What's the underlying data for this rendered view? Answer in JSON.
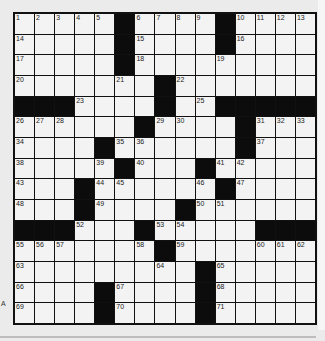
{
  "puzzle": {
    "size": {
      "rows": 15,
      "cols": 15
    },
    "layout": [
      ".....#....#....",
      ".....#....#....",
      ".....#.........",
      ".......#.......",
      "###....#..#####",
      "......#....#...",
      "....#......#...",
      ".....#...#.....",
      "...#......#....",
      "...#....#......",
      "###...#.....###",
      ".......#.......",
      ".........#.....",
      "....#....#.....",
      "....#....#....."
    ],
    "numbers": [
      {
        "r": 0,
        "c": 0,
        "n": "1"
      },
      {
        "r": 0,
        "c": 1,
        "n": "2"
      },
      {
        "r": 0,
        "c": 2,
        "n": "3"
      },
      {
        "r": 0,
        "c": 3,
        "n": "4"
      },
      {
        "r": 0,
        "c": 4,
        "n": "5"
      },
      {
        "r": 0,
        "c": 6,
        "n": "6"
      },
      {
        "r": 0,
        "c": 7,
        "n": "7"
      },
      {
        "r": 0,
        "c": 8,
        "n": "8"
      },
      {
        "r": 0,
        "c": 9,
        "n": "9"
      },
      {
        "r": 0,
        "c": 11,
        "n": "10"
      },
      {
        "r": 0,
        "c": 12,
        "n": "11"
      },
      {
        "r": 0,
        "c": 13,
        "n": "12"
      },
      {
        "r": 0,
        "c": 14,
        "n": "13"
      },
      {
        "r": 1,
        "c": 0,
        "n": "14"
      },
      {
        "r": 1,
        "c": 6,
        "n": "15"
      },
      {
        "r": 1,
        "c": 11,
        "n": "16"
      },
      {
        "r": 2,
        "c": 0,
        "n": "17"
      },
      {
        "r": 2,
        "c": 6,
        "n": "18"
      },
      {
        "r": 2,
        "c": 10,
        "n": "19"
      },
      {
        "r": 3,
        "c": 0,
        "n": "20"
      },
      {
        "r": 3,
        "c": 5,
        "n": "21"
      },
      {
        "r": 3,
        "c": 8,
        "n": "22"
      },
      {
        "r": 4,
        "c": 3,
        "n": "23"
      },
      {
        "r": 4,
        "c": 7,
        "n": "24"
      },
      {
        "r": 4,
        "c": 9,
        "n": "25"
      },
      {
        "r": 5,
        "c": 0,
        "n": "26"
      },
      {
        "r": 5,
        "c": 1,
        "n": "27"
      },
      {
        "r": 5,
        "c": 2,
        "n": "28"
      },
      {
        "r": 5,
        "c": 7,
        "n": "29"
      },
      {
        "r": 5,
        "c": 8,
        "n": "30"
      },
      {
        "r": 5,
        "c": 12,
        "n": "31"
      },
      {
        "r": 5,
        "c": 13,
        "n": "32"
      },
      {
        "r": 5,
        "c": 14,
        "n": "33"
      },
      {
        "r": 6,
        "c": 0,
        "n": "34"
      },
      {
        "r": 6,
        "c": 5,
        "n": "35"
      },
      {
        "r": 6,
        "c": 6,
        "n": "36"
      },
      {
        "r": 6,
        "c": 12,
        "n": "37"
      },
      {
        "r": 7,
        "c": 0,
        "n": "38"
      },
      {
        "r": 7,
        "c": 4,
        "n": "39"
      },
      {
        "r": 7,
        "c": 6,
        "n": "40"
      },
      {
        "r": 7,
        "c": 10,
        "n": "41"
      },
      {
        "r": 7,
        "c": 11,
        "n": "42"
      },
      {
        "r": 8,
        "c": 0,
        "n": "43"
      },
      {
        "r": 8,
        "c": 4,
        "n": "44"
      },
      {
        "r": 8,
        "c": 5,
        "n": "45"
      },
      {
        "r": 8,
        "c": 9,
        "n": "46"
      },
      {
        "r": 8,
        "c": 11,
        "n": "47"
      },
      {
        "r": 9,
        "c": 0,
        "n": "48"
      },
      {
        "r": 9,
        "c": 4,
        "n": "49"
      },
      {
        "r": 9,
        "c": 9,
        "n": "50"
      },
      {
        "r": 9,
        "c": 10,
        "n": "51"
      },
      {
        "r": 10,
        "c": 3,
        "n": "52"
      },
      {
        "r": 10,
        "c": 7,
        "n": "53"
      },
      {
        "r": 10,
        "c": 8,
        "n": "54"
      },
      {
        "r": 11,
        "c": 0,
        "n": "55"
      },
      {
        "r": 11,
        "c": 1,
        "n": "56"
      },
      {
        "r": 11,
        "c": 2,
        "n": "57"
      },
      {
        "r": 11,
        "c": 6,
        "n": "58"
      },
      {
        "r": 11,
        "c": 8,
        "n": "59"
      },
      {
        "r": 11,
        "c": 12,
        "n": "60"
      },
      {
        "r": 11,
        "c": 13,
        "n": "61"
      },
      {
        "r": 11,
        "c": 14,
        "n": "62"
      },
      {
        "r": 12,
        "c": 0,
        "n": "63"
      },
      {
        "r": 12,
        "c": 7,
        "n": "64"
      },
      {
        "r": 12,
        "c": 10,
        "n": "65"
      },
      {
        "r": 13,
        "c": 0,
        "n": "66"
      },
      {
        "r": 13,
        "c": 5,
        "n": "67"
      },
      {
        "r": 13,
        "c": 10,
        "n": "68"
      },
      {
        "r": 14,
        "c": 0,
        "n": "69"
      },
      {
        "r": 14,
        "c": 5,
        "n": "70"
      },
      {
        "r": 14,
        "c": 10,
        "n": "71"
      }
    ]
  },
  "side_mark": "A",
  "colors": {
    "background": "#ebebeb",
    "cell": "#f3f3f3",
    "block": "#0c0c0c",
    "gridline": "#111111"
  }
}
